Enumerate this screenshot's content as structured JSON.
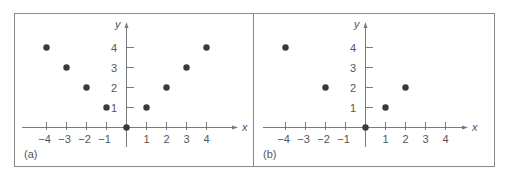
{
  "chart_data": [
    {
      "type": "scatter",
      "panel_label": "(a)",
      "xlabel": "x",
      "ylabel": "y",
      "x_ticks": [
        -4,
        -3,
        -2,
        -1,
        1,
        2,
        3,
        4
      ],
      "x_tick_labels": [
        "−4",
        "−3",
        "−2",
        "−1",
        "1",
        "2",
        "3",
        "4"
      ],
      "y_ticks": [
        1,
        2,
        3,
        4
      ],
      "y_tick_labels": [
        "1",
        "2",
        "3",
        "4"
      ],
      "xlim": [
        -5,
        5
      ],
      "ylim": [
        -1,
        5
      ],
      "grid": false,
      "points": [
        {
          "x": -4,
          "y": 4
        },
        {
          "x": -3,
          "y": 3
        },
        {
          "x": -2,
          "y": 2
        },
        {
          "x": -1,
          "y": 1
        },
        {
          "x": 0,
          "y": 0
        },
        {
          "x": 1,
          "y": 1
        },
        {
          "x": 2,
          "y": 2
        },
        {
          "x": 3,
          "y": 3
        },
        {
          "x": 4,
          "y": 4
        }
      ]
    },
    {
      "type": "scatter",
      "panel_label": "(b)",
      "xlabel": "x",
      "ylabel": "y",
      "x_ticks": [
        -4,
        -3,
        -2,
        -1,
        1,
        2,
        3,
        4
      ],
      "x_tick_labels": [
        "−4",
        "−3",
        "−2",
        "−1",
        "1",
        "2",
        "3",
        "4"
      ],
      "y_ticks": [
        1,
        2,
        3,
        4
      ],
      "y_tick_labels": [
        "1",
        "2",
        "3",
        "4"
      ],
      "xlim": [
        -5,
        5
      ],
      "ylim": [
        -1,
        5
      ],
      "grid": false,
      "points": [
        {
          "x": -4,
          "y": 4
        },
        {
          "x": -2,
          "y": 2
        },
        {
          "x": 0,
          "y": 0
        },
        {
          "x": 1,
          "y": 1
        },
        {
          "x": 2,
          "y": 2
        }
      ]
    }
  ],
  "style": {
    "frame_color": "#8a8a8a",
    "axis_color": "#7a7a7a",
    "point_color": "#3a3a3a",
    "text_color": "#555555"
  }
}
